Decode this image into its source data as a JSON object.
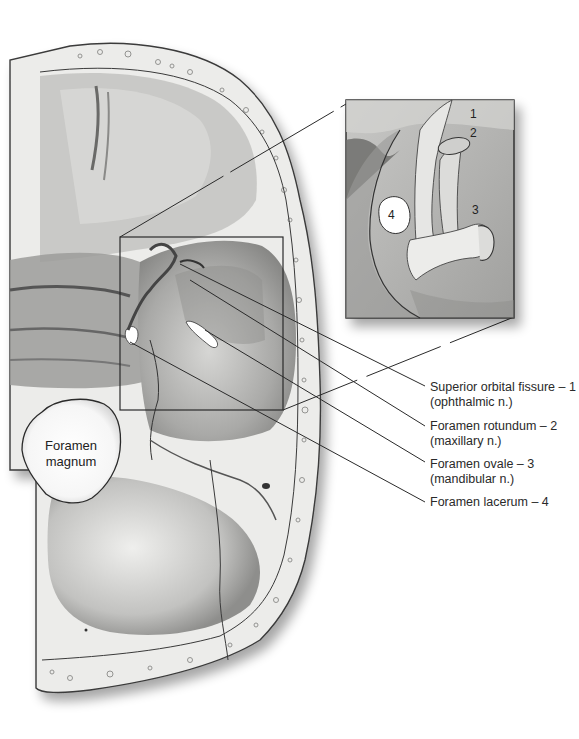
{
  "figure": {
    "colors": {
      "background": "#ffffff",
      "bone_light": "#e8e8e6",
      "bone_mid": "#b8b8b6",
      "bone_dark": "#6e6e6c",
      "outline": "#333333",
      "leader_line": "#2a2a2a"
    }
  },
  "labels": [
    {
      "id": "superior-orbital-fissure",
      "line1": "Superior orbital fissure – 1",
      "line2": "(ophthalmic n.)"
    },
    {
      "id": "foramen-rotundum",
      "line1": "Foramen rotundum – 2",
      "line2": "(maxillary n.)"
    },
    {
      "id": "foramen-ovale",
      "line1": "Foramen ovale – 3",
      "line2": "(mandibular n.)"
    },
    {
      "id": "foramen-lacerum",
      "line1": "Foramen lacerum – 4",
      "line2": ""
    }
  ],
  "foramen_magnum": {
    "line1": "Foramen",
    "line2": "magnum"
  },
  "inset": {
    "numbers": [
      "1",
      "2",
      "3",
      "4"
    ]
  }
}
